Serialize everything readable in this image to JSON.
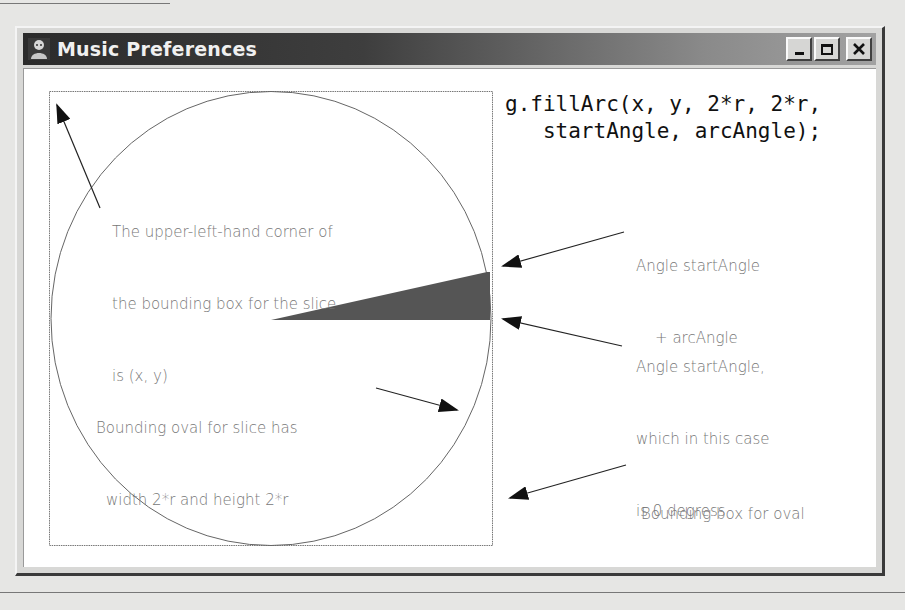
{
  "window": {
    "title": "Music Preferences",
    "icon": "app-icon",
    "buttons": {
      "minimize": "minimize-icon",
      "maximize": "maximize-icon",
      "close": "close-icon"
    }
  },
  "code": {
    "line1": "g.fillArc(x, y, 2*r, 2*r,",
    "line2": "   startAngle, arcAngle);"
  },
  "annotations": {
    "upper_left": {
      "line1": "The upper-left-hand corner of",
      "line2": "the bounding box for the slice",
      "line3": "is (x, y)"
    },
    "end_angle": {
      "line1": "Angle startAngle",
      "line2": "    + arcAngle"
    },
    "start_angle": {
      "line1": "Angle startAngle,",
      "line2": "which in this case",
      "line3": "is 0 degress"
    },
    "oval": {
      "line1": "Bounding oval for slice has",
      "line2": "width 2*r and height 2*r"
    },
    "box": {
      "line1": "Bounding box for oval"
    }
  },
  "colors": {
    "slice_fill": "#555555",
    "title_bar_dark": "#2b2b2b",
    "annotation_text": "#777777"
  }
}
